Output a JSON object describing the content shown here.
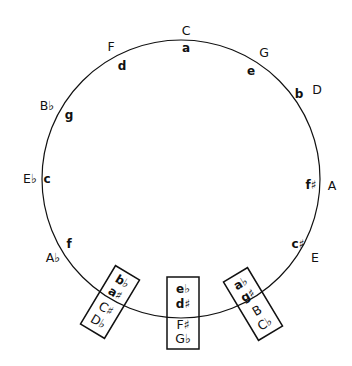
{
  "diagram": {
    "colors": {
      "ink": "#111111",
      "background": "#ffffff"
    },
    "circle": {
      "cx": 181,
      "cy": 179,
      "r": 139
    },
    "positions": [
      {
        "major": "C",
        "minor": "a",
        "major_xy": [
          186,
          35
        ],
        "minor_xy": [
          186,
          51
        ]
      },
      {
        "major": "G",
        "minor": "e",
        "major_xy": [
          262,
          56
        ],
        "minor_xy": [
          250,
          72
        ]
      },
      {
        "major": "D",
        "minor": "b",
        "major_xy": [
          317,
          93
        ],
        "minor_xy": [
          299,
          97
        ]
      },
      {
        "major": "A",
        "minor": "f♯",
        "major_xy": [
          330,
          185
        ],
        "minor_xy": [
          309,
          184
        ]
      },
      {
        "major": "E",
        "minor": "c♯",
        "major_xy": [
          314,
          261
        ],
        "minor_xy": [
          298,
          246
        ]
      },
      {
        "major": "B♭",
        "minor": "g",
        "major_xy": [
          46,
          107
        ],
        "minor_xy": [
          68,
          119
        ]
      },
      {
        "major": "E♭",
        "minor": "c",
        "major_xy": [
          27,
          180
        ],
        "minor_xy": [
          48,
          180
        ]
      },
      {
        "major": "A♭",
        "minor": "f",
        "major_xy": [
          56,
          263
        ],
        "minor_xy": [
          70,
          246
        ]
      },
      {
        "major": "F",
        "minor": "d",
        "major_xy": [
          111,
          50
        ],
        "minor_xy": [
          121,
          68
        ]
      }
    ],
    "enharmonic_boxes": [
      {
        "id": "left",
        "rotation": 31,
        "center": [
          110,
          302
        ],
        "size": [
          28,
          66
        ],
        "lines": [
          "b♭",
          "a♯",
          "C♯",
          "D♭"
        ]
      },
      {
        "id": "middle",
        "rotation": 0,
        "center": [
          183,
          313
        ],
        "size": [
          32,
          72
        ],
        "lines": [
          "e♭",
          "d♯",
          "F♯",
          "G♭"
        ]
      },
      {
        "id": "right",
        "rotation": -31,
        "center": [
          253,
          304
        ],
        "size": [
          28,
          66
        ],
        "lines": [
          "a♭",
          "g♯",
          "B",
          "C♭"
        ]
      }
    ]
  }
}
